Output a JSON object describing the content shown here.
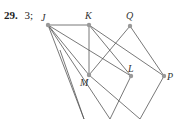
{
  "answer": {
    "number": "29.",
    "value": "3;"
  },
  "graph": {
    "vertices": [
      {
        "id": "J",
        "x": 48,
        "y": 25,
        "lx": 41,
        "ly": 21
      },
      {
        "id": "K",
        "x": 89,
        "y": 25,
        "lx": 85,
        "ly": 19
      },
      {
        "id": "Q",
        "x": 130,
        "y": 26,
        "lx": 126,
        "ly": 19
      },
      {
        "id": "M",
        "x": 89,
        "y": 75,
        "lx": 80,
        "ly": 86
      },
      {
        "id": "L",
        "x": 131,
        "y": 76,
        "lx": 128,
        "ly": 72
      },
      {
        "id": "P",
        "x": 164,
        "y": 76,
        "lx": 167,
        "ly": 80
      }
    ],
    "edges": [
      [
        48,
        25,
        89,
        25
      ],
      [
        48,
        25,
        89,
        75
      ],
      [
        48,
        25,
        131,
        76
      ],
      [
        48,
        25,
        84,
        119
      ],
      [
        48,
        25,
        110,
        119
      ],
      [
        89,
        25,
        89,
        75
      ],
      [
        89,
        25,
        131,
        76
      ],
      [
        89,
        25,
        164,
        76
      ],
      [
        130,
        26,
        89,
        75
      ],
      [
        130,
        26,
        164,
        76
      ],
      [
        89,
        75,
        140,
        119
      ],
      [
        131,
        76,
        110,
        119
      ],
      [
        164,
        76,
        140,
        119
      ],
      [
        60,
        50,
        84,
        119
      ]
    ],
    "colors": {
      "edge": "#555555",
      "vertex": "#999999"
    }
  }
}
